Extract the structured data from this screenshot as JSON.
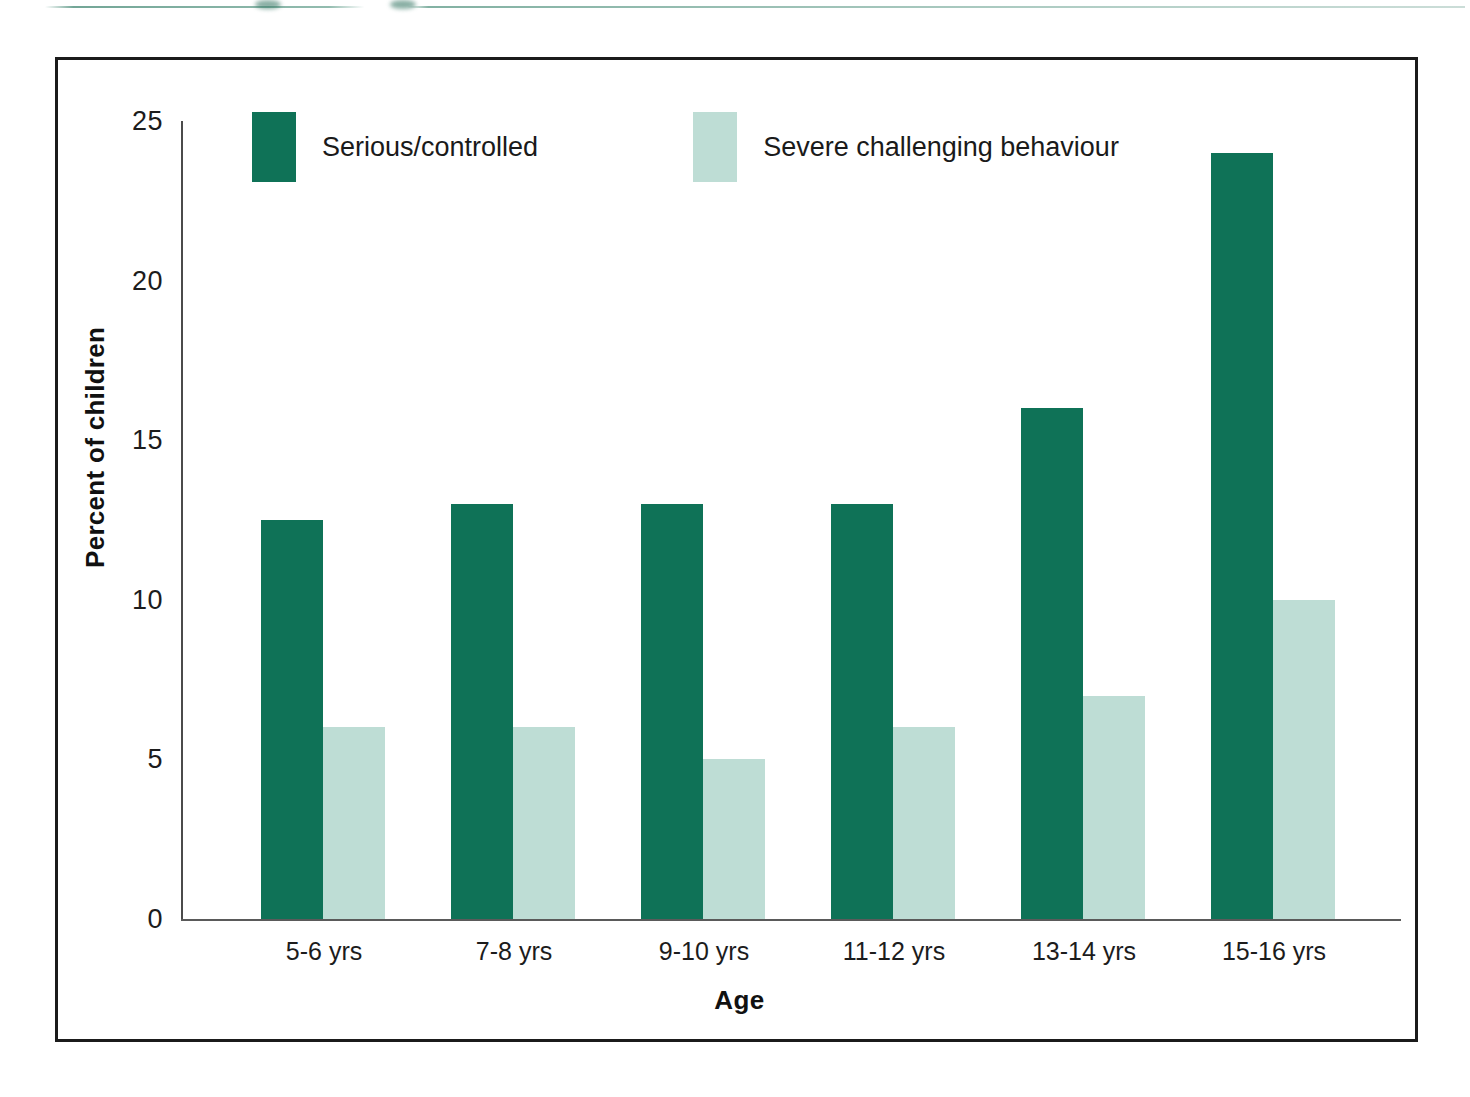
{
  "figure": {
    "top_rule_present": true
  },
  "chart_data": {
    "type": "bar",
    "title": "",
    "subtitle": "",
    "xlabel": "Age",
    "ylabel": "Percent of children",
    "categories": [
      "5-6 yrs",
      "7-8 yrs",
      "9-10 yrs",
      "11-12 yrs",
      "13-14 yrs",
      "15-16 yrs"
    ],
    "series": [
      {
        "name": "Serious/controlled",
        "color": "#0F7257",
        "values": [
          12.5,
          13,
          13,
          13,
          16,
          24
        ]
      },
      {
        "name": "Severe challenging behaviour",
        "color": "#BEDDD5",
        "values": [
          6,
          6,
          5,
          6,
          7,
          10
        ]
      }
    ],
    "ylim": [
      0,
      25
    ],
    "yticks": [
      0,
      5,
      10,
      15,
      20,
      25
    ],
    "ytick_labels": [
      "0",
      "5",
      "10",
      "15",
      "20",
      "25"
    ],
    "grid": false,
    "legend_position": "top-left-inside"
  }
}
